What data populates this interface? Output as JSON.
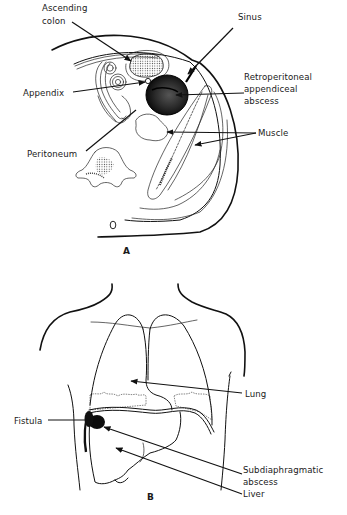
{
  "figure_a": {
    "caption": "A",
    "labels": {
      "ascending_colon_line1": "Ascending",
      "ascending_colon_line2": "colon",
      "sinus": "Sinus",
      "appendix": "Appendix",
      "retro_line1": "Retroperitoneal",
      "retro_line2": "appendiceal",
      "retro_line3": "abscess",
      "muscle": "Muscle",
      "peritoneum": "Peritoneum"
    }
  },
  "figure_b": {
    "caption": "B",
    "labels": {
      "lung": "Lung",
      "fistula": "Fistula",
      "subdiaphragmatic_line1": "Subdiaphragmatic",
      "subdiaphragmatic_line2": "abscess",
      "liver": "Liver"
    }
  }
}
